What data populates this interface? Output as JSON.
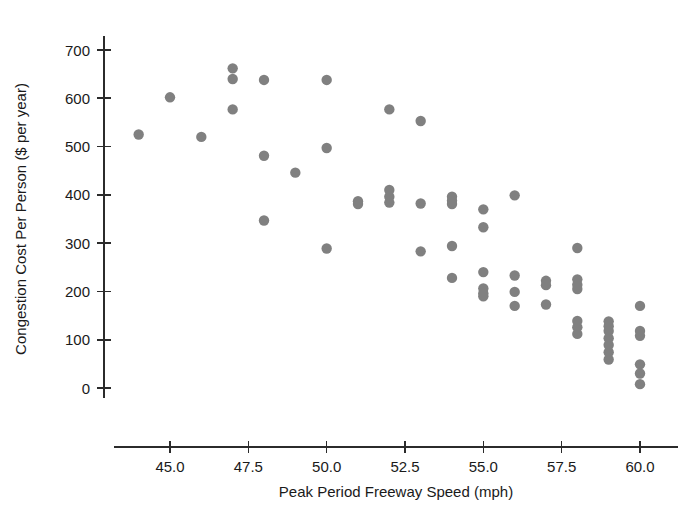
{
  "chart_data": {
    "type": "scatter",
    "title": "",
    "xlabel": "Peak Period Freeway Speed (mph)",
    "ylabel": "Congestion Cost Per Person ($ per year)",
    "xlim": [
      43.2,
      61.2
    ],
    "ylim": [
      -20,
      730
    ],
    "xticks": [
      45.0,
      47.5,
      50.0,
      52.5,
      55.0,
      57.5,
      60.0
    ],
    "xtick_labels": [
      "45.0",
      "47.5",
      "50.0",
      "52.5",
      "55.0",
      "57.5",
      "60.0"
    ],
    "yticks": [
      0,
      100,
      200,
      300,
      400,
      500,
      600,
      700
    ],
    "ytick_labels": [
      "0",
      "100",
      "200",
      "300",
      "400",
      "500",
      "600",
      "700"
    ],
    "grid": false,
    "legend": null,
    "marker": {
      "shape": "circle",
      "color": "#808080",
      "radius_px": 5.2
    },
    "series": [
      {
        "name": "Urban areas",
        "color": "#808080",
        "points": [
          [
            44.0,
            525
          ],
          [
            45.0,
            602
          ],
          [
            46.0,
            520
          ],
          [
            47.0,
            662
          ],
          [
            47.0,
            640
          ],
          [
            47.0,
            577
          ],
          [
            48.0,
            638
          ],
          [
            48.0,
            481
          ],
          [
            48.0,
            347
          ],
          [
            49.0,
            446
          ],
          [
            50.0,
            638
          ],
          [
            50.0,
            497
          ],
          [
            50.0,
            289
          ],
          [
            51.0,
            387
          ],
          [
            51.0,
            381
          ],
          [
            52.0,
            577
          ],
          [
            52.0,
            410
          ],
          [
            52.0,
            396
          ],
          [
            52.0,
            384
          ],
          [
            53.0,
            553
          ],
          [
            53.0,
            382
          ],
          [
            53.0,
            283
          ],
          [
            54.0,
            396
          ],
          [
            54.0,
            388
          ],
          [
            54.0,
            381
          ],
          [
            54.0,
            294
          ],
          [
            54.0,
            228
          ],
          [
            55.0,
            370
          ],
          [
            55.0,
            333
          ],
          [
            55.0,
            240
          ],
          [
            55.0,
            206
          ],
          [
            55.0,
            196
          ],
          [
            55.0,
            190
          ],
          [
            56.0,
            399
          ],
          [
            56.0,
            233
          ],
          [
            56.0,
            199
          ],
          [
            56.0,
            170
          ],
          [
            57.0,
            222
          ],
          [
            57.0,
            213
          ],
          [
            57.0,
            173
          ],
          [
            58.0,
            290
          ],
          [
            58.0,
            225
          ],
          [
            58.0,
            214
          ],
          [
            58.0,
            205
          ],
          [
            58.0,
            139
          ],
          [
            58.0,
            126
          ],
          [
            58.0,
            112
          ],
          [
            59.0,
            138
          ],
          [
            59.0,
            128
          ],
          [
            59.0,
            118
          ],
          [
            59.0,
            103
          ],
          [
            59.0,
            89
          ],
          [
            59.0,
            74
          ],
          [
            59.0,
            59
          ],
          [
            60.0,
            170
          ],
          [
            60.0,
            118
          ],
          [
            60.0,
            108
          ],
          [
            60.0,
            49
          ],
          [
            60.0,
            30
          ],
          [
            60.0,
            8
          ]
        ]
      }
    ]
  },
  "axes": {
    "x_title": "Peak Period Freeway Speed (mph)",
    "y_title": "Congestion Cost Per Person ($ per year)"
  }
}
